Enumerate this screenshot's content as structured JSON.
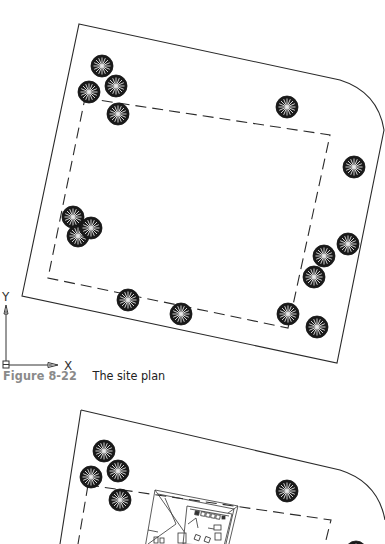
{
  "figure_1": {
    "number": "Figure 8-22",
    "title": "The site plan",
    "boundary": {
      "style": "solid",
      "vertices": [
        [
          79,
          24
        ],
        [
          345,
          81
        ],
        [
          385,
          130
        ],
        [
          337,
          363
        ],
        [
          22,
          296
        ]
      ]
    },
    "setback": {
      "style": "dashed",
      "vertices": [
        [
          85,
          98
        ],
        [
          330,
          135
        ],
        [
          288,
          328
        ],
        [
          48,
          278
        ]
      ]
    },
    "trees": [
      {
        "x": 102,
        "y": 66
      },
      {
        "x": 89,
        "y": 92
      },
      {
        "x": 116,
        "y": 86
      },
      {
        "x": 118,
        "y": 114
      },
      {
        "x": 287,
        "y": 107
      },
      {
        "x": 354,
        "y": 167
      },
      {
        "x": 73,
        "y": 217
      },
      {
        "x": 91,
        "y": 228
      },
      {
        "x": 78,
        "y": 236
      },
      {
        "x": 348,
        "y": 244
      },
      {
        "x": 324,
        "y": 256
      },
      {
        "x": 314,
        "y": 277
      },
      {
        "x": 128,
        "y": 300
      },
      {
        "x": 181,
        "y": 314
      },
      {
        "x": 288,
        "y": 314
      },
      {
        "x": 317,
        "y": 327
      }
    ]
  },
  "ucs_icon": {
    "x_label": "X",
    "y_label": "Y"
  },
  "figure_2": {
    "boundary": {
      "style": "solid",
      "vertices": [
        [
          81,
          410
        ],
        [
          345,
          470
        ],
        [
          385,
          520
        ],
        [
          385,
          544
        ],
        [
          60,
          544
        ]
      ]
    },
    "setback": {
      "style": "dashed",
      "vertices": [
        [
          88,
          485
        ],
        [
          331,
          520
        ],
        [
          325,
          544
        ],
        [
          78,
          544
        ]
      ]
    },
    "trees": [
      {
        "x": 104,
        "y": 451
      },
      {
        "x": 91,
        "y": 477
      },
      {
        "x": 118,
        "y": 471
      },
      {
        "x": 120,
        "y": 500
      },
      {
        "x": 287,
        "y": 491
      },
      {
        "x": 356,
        "y": 547
      }
    ],
    "house": {
      "label": "house-plan"
    }
  }
}
